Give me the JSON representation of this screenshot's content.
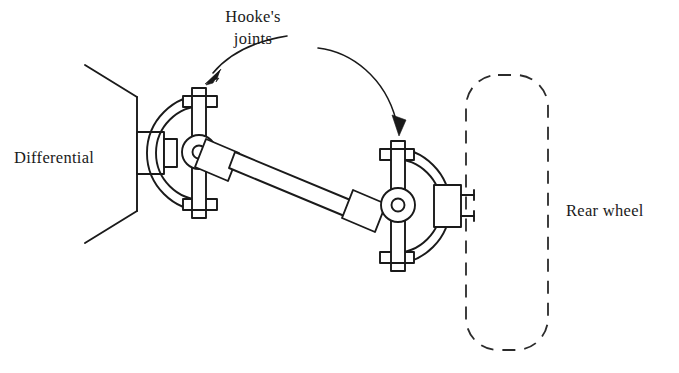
{
  "figure": {
    "background_color": "#ffffff",
    "ink_color": "#1a1a1a"
  },
  "labels": {
    "differential": "Differential",
    "hookes_line1": "Hooke's",
    "hookes_line2": "joints",
    "rear_wheel": "Rear wheel"
  },
  "components": {
    "differential_housing": "differential-housing",
    "left_joint": "left-hookes-joint",
    "right_joint": "right-hookes-joint",
    "drive_shaft": "drive-shaft",
    "wheel_hub": "wheel-hub",
    "rear_wheel": "rear-wheel-outline"
  },
  "annotations": {
    "left_arrow": "leader-arrow-to-left-joint",
    "right_arrow": "leader-arrow-to-right-joint"
  }
}
